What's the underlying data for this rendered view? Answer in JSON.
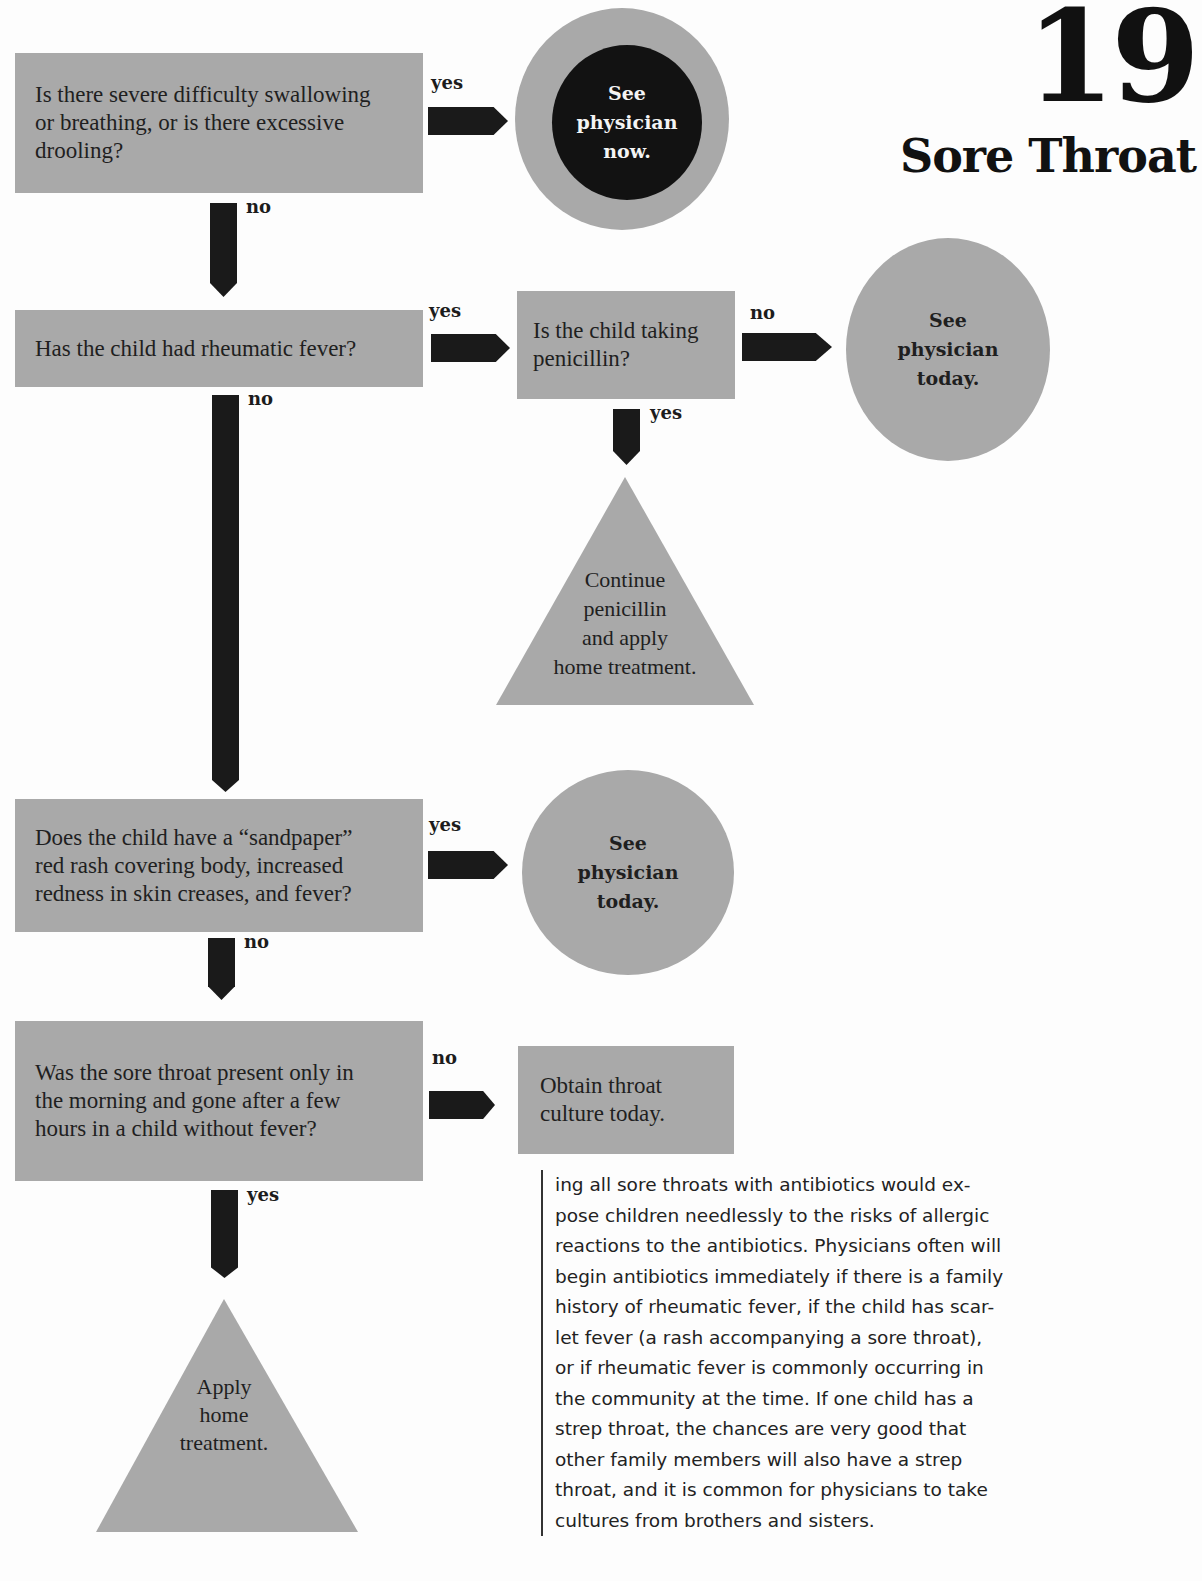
{
  "header": {
    "chapter_number": "19",
    "chapter_title": "Sore Throat"
  },
  "flowchart": {
    "q1": {
      "text_lines": [
        "Is there severe difficulty swallowing",
        "or breathing, or is there excessive",
        "drooling?"
      ],
      "yes_label": "yes",
      "no_label": "no",
      "yes_outcome": [
        "See",
        "physician",
        "now."
      ]
    },
    "q2": {
      "text": "Has the child had rheumatic fever?",
      "yes_label": "yes",
      "no_label": "no"
    },
    "q2a": {
      "text_lines": [
        "Is the child taking",
        "penicillin?"
      ],
      "no_label": "no",
      "yes_label": "yes",
      "no_outcome": [
        "See",
        "physician",
        "today."
      ],
      "yes_outcome": [
        "Continue",
        "penicillin",
        "and apply",
        "home treatment."
      ]
    },
    "q3": {
      "text_lines": [
        "Does the child have a “sandpaper”",
        "red rash covering body, increased",
        "redness in skin creases, and fever?"
      ],
      "yes_label": "yes",
      "no_label": "no",
      "yes_outcome": [
        "See",
        "physician",
        "today."
      ]
    },
    "q4": {
      "text_lines": [
        "Was the sore throat present only in",
        "the morning and gone after a few",
        "hours in a child without fever?"
      ],
      "no_label": "no",
      "yes_label": "yes",
      "no_outcome": [
        "Obtain throat",
        "culture today."
      ],
      "yes_outcome": [
        "Apply",
        "home",
        "treatment."
      ]
    }
  },
  "body_text": {
    "lines": [
      "ing all sore throats with antibiotics would ex-",
      "pose children needlessly to the risks of allergic",
      "reactions to the antibiotics. Physicians often will",
      "begin antibiotics immediately if there is a family",
      "history of rheumatic fever, if the child has scar-",
      "let fever (a rash accompanying a sore throat),",
      "or if rheumatic fever is commonly occurring in",
      "the community at the time. If one child has a",
      "strep throat, the chances are very good that",
      "other family members will also have a strep",
      "throat, and it is common for physicians to take",
      "cultures from brothers and sisters."
    ]
  },
  "colors": {
    "shape_fill": "#a9a9a9",
    "arrow_fill": "#1a1a1a",
    "emergency_fill": "#121212",
    "background": "#fdfdfd"
  }
}
